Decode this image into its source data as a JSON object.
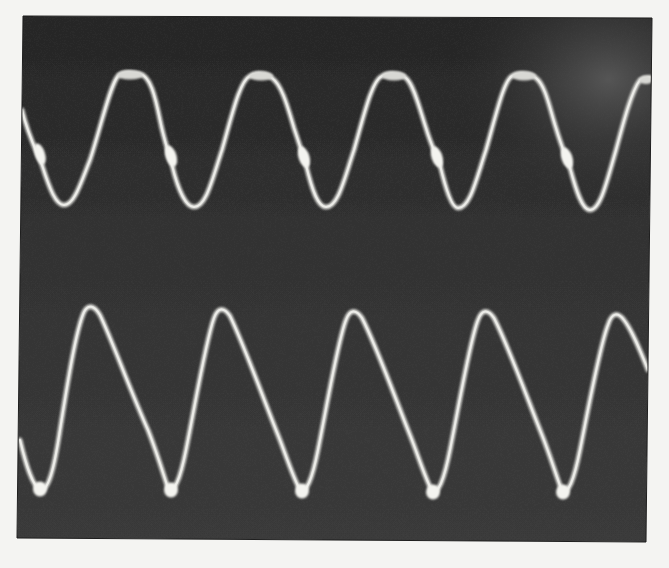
{
  "image": {
    "description": "Oscilloscope screen photograph showing two periodic waveform traces",
    "paper_color": "#f4f4f2",
    "screen": {
      "corners": [
        [
          23,
          16
        ],
        [
          652,
          18
        ],
        [
          646,
          542
        ],
        [
          17,
          538
        ]
      ],
      "color_dark": "#2a2a2a",
      "color_mid": "#3a3a3a",
      "glare_color": "#5a5a5a"
    },
    "trace_color": "#d8d8d4",
    "spot_color": "#f2f2ee",
    "traces": [
      {
        "name": "upper-trace",
        "shape": "sinusoid with flattened/notched peaks and bright intensified spots on the falling edge",
        "period_px": 131,
        "peak_y": 74,
        "trough_y": 205,
        "peaks_x": [
          130,
          260,
          393,
          523,
          648
        ],
        "troughs_x": [
          62,
          192,
          325,
          455,
          585
        ],
        "bright_spots": [
          [
            40,
            153
          ],
          [
            170,
            155
          ],
          [
            303,
            158
          ],
          [
            437,
            158
          ],
          [
            567,
            158
          ]
        ]
      },
      {
        "name": "lower-trace",
        "shape": "asymmetric sawtooth-like wave: fast rise, slow fall, bright spots at troughs",
        "period_px": 131,
        "peak_y": 308,
        "trough_y": 490,
        "peaks_x": [
          90,
          220,
          352,
          484,
          615
        ],
        "troughs_x": [
          40,
          170,
          302,
          433,
          563
        ],
        "bright_spots": [
          [
            40,
            490
          ],
          [
            171,
            490
          ],
          [
            302,
            491
          ],
          [
            433,
            492
          ],
          [
            563,
            492
          ]
        ]
      }
    ]
  }
}
